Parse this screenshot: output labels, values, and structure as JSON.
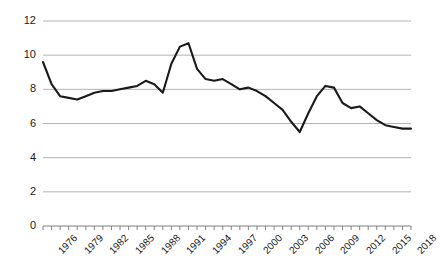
{
  "chart_data": {
    "type": "line",
    "title": "",
    "subtitle": "",
    "xlabel": "",
    "ylabel": "",
    "xlim": [
      1976,
      2019
    ],
    "ylim": [
      0,
      12
    ],
    "grid": true,
    "grid_axis": "y",
    "legend": false,
    "legend_position": "none",
    "line_color": "#1a1a1a",
    "grid_color": "#b3b3b3",
    "axis_color": "#808080",
    "y_ticks": [
      0,
      2,
      4,
      6,
      8,
      10,
      12
    ],
    "y_tick_labels": [
      "0",
      "2",
      "4",
      "6",
      "8",
      "10",
      "12"
    ],
    "x_tick_labels": [
      "1976",
      "1979",
      "1982",
      "1985",
      "1988",
      "1991",
      "1994",
      "1997",
      "2000",
      "2003",
      "2006",
      "2009",
      "2012",
      "2015",
      "2018"
    ],
    "x_tick_label_rotation": -45,
    "x_minor_ticks_every": 1,
    "x_label_every": 3,
    "x": [
      1976,
      1977,
      1978,
      1979,
      1980,
      1981,
      1982,
      1983,
      1984,
      1985,
      1986,
      1987,
      1988,
      1989,
      1990,
      1991,
      1992,
      1993,
      1994,
      1995,
      1996,
      1997,
      1998,
      1999,
      2000,
      2001,
      2002,
      2003,
      2004,
      2005,
      2006,
      2007,
      2008,
      2009,
      2010,
      2011,
      2012,
      2013,
      2014,
      2015,
      2016,
      2017,
      2018,
      2019
    ],
    "values": [
      9.6,
      8.3,
      7.6,
      7.5,
      7.4,
      7.6,
      7.8,
      7.9,
      7.9,
      8.0,
      8.1,
      8.2,
      8.5,
      8.3,
      7.8,
      9.5,
      10.5,
      10.7,
      9.2,
      8.6,
      8.5,
      8.6,
      8.3,
      8.0,
      8.1,
      7.9,
      7.6,
      7.2,
      6.8,
      6.1,
      5.5,
      6.6,
      7.6,
      8.2,
      8.1,
      7.2,
      6.9,
      7.0,
      6.6,
      6.2,
      5.9,
      5.8,
      5.7,
      5.7
    ],
    "series": [
      {
        "name": "series-1",
        "values": [
          9.6,
          8.3,
          7.6,
          7.5,
          7.4,
          7.6,
          7.8,
          7.9,
          7.9,
          8.0,
          8.1,
          8.2,
          8.5,
          8.3,
          7.8,
          9.5,
          10.5,
          10.7,
          9.2,
          8.6,
          8.5,
          8.6,
          8.3,
          8.0,
          8.1,
          7.9,
          7.6,
          7.2,
          6.8,
          6.1,
          5.5,
          6.6,
          7.6,
          8.2,
          8.1,
          7.2,
          6.9,
          7.0,
          6.6,
          6.2,
          5.9,
          5.8,
          5.7,
          5.7
        ]
      }
    ]
  },
  "layout": {
    "plot_left": 43,
    "plot_right": 411,
    "plot_top": 21,
    "plot_bottom": 226
  }
}
